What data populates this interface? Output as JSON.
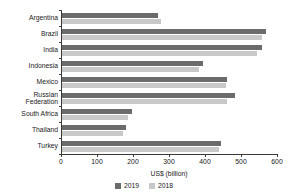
{
  "chart_data": {
    "type": "bar",
    "orientation": "horizontal",
    "title": "",
    "xlabel": "US$ (billion)",
    "ylabel": "",
    "xlim": [
      0,
      600
    ],
    "xticks": [
      0,
      100,
      200,
      300,
      400,
      500,
      600
    ],
    "grid": false,
    "legend_position": "bottom",
    "categories": [
      "Argentina",
      "Brazil",
      "India",
      "Indonesia",
      "Mexico",
      "Russian\nFederation",
      "South Africa",
      "Thailand",
      "Turkey"
    ],
    "series": [
      {
        "name": "2019",
        "color": "#6b6b6b",
        "values": [
          267,
          567,
          556,
          392,
          458,
          481,
          195,
          178,
          442
        ]
      },
      {
        "name": "2018",
        "color": "#c8c8c8",
        "values": [
          275,
          556,
          542,
          381,
          456,
          458,
          183,
          169,
          436
        ]
      }
    ]
  }
}
